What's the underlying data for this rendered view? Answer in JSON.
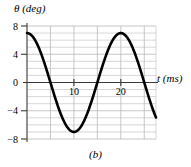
{
  "figure": {
    "caption": "(b)",
    "axis": {
      "y_label": "θ (deg)",
      "y_label_symbol": "θ",
      "y_label_unit": "(deg)",
      "x_label": "t (ms)",
      "x_label_symbol": "t",
      "x_label_unit": "(ms)"
    }
  },
  "chart_data": {
    "type": "line",
    "title": "",
    "subtitle": "",
    "xlabel": "t (ms)",
    "ylabel": "θ (deg)",
    "xlim": [
      0,
      27.5
    ],
    "ylim": [
      -8,
      8
    ],
    "xticks": [
      10,
      20
    ],
    "xtick_labels": [
      "10",
      "20"
    ],
    "yticks": [
      -8,
      -4,
      0,
      4,
      8
    ],
    "ytick_labels": [
      "−8",
      "−4",
      "0",
      "4",
      "8"
    ],
    "grid": true,
    "grid_minor_y_step": 1,
    "grid_major_x_step": 5,
    "legend": "none",
    "series": [
      {
        "name": "theta",
        "description": "cosine, amplitude 7 deg, period 20 ms, starts at +7 deg",
        "amplitude": 7,
        "period": 20,
        "phase_deg": 0,
        "x": [
          0,
          1,
          2,
          3,
          4,
          5,
          6,
          7,
          8,
          9,
          10,
          11,
          12,
          13,
          14,
          15,
          16,
          17,
          18,
          19,
          20,
          21,
          22,
          23,
          24,
          25,
          26,
          27.5
        ],
        "values": [
          7.0,
          6.66,
          5.66,
          4.12,
          2.16,
          0.0,
          -2.16,
          -4.12,
          -5.66,
          -6.66,
          -7.0,
          -6.66,
          -5.66,
          -4.12,
          -2.16,
          0.0,
          2.16,
          4.12,
          5.66,
          6.66,
          7.0,
          6.66,
          5.66,
          4.12,
          2.16,
          0.0,
          -2.16,
          -5.2
        ]
      }
    ],
    "annotations": []
  },
  "colors": {
    "curve": "#000000",
    "axis": "#3a3a3a",
    "gridline": "#b9b9b9",
    "gridline_major": "#a0a0a0",
    "background": "#ffffff"
  }
}
